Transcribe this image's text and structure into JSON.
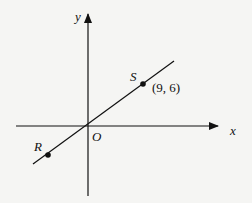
{
  "diagram": {
    "type": "coordinate-plane-line",
    "axes": {
      "x_label": "x",
      "y_label": "y",
      "origin_label": "O"
    },
    "points": [
      {
        "name": "S",
        "coords": [
          9,
          6
        ],
        "coord_label": "(9, 6)"
      },
      {
        "name": "R",
        "coords": null,
        "coord_label": ""
      }
    ],
    "line": {
      "through": [
        "O",
        "S",
        "R"
      ],
      "slope": "2/3"
    },
    "colors": {
      "ink": "#111111",
      "background": "#f5f5f3"
    }
  }
}
